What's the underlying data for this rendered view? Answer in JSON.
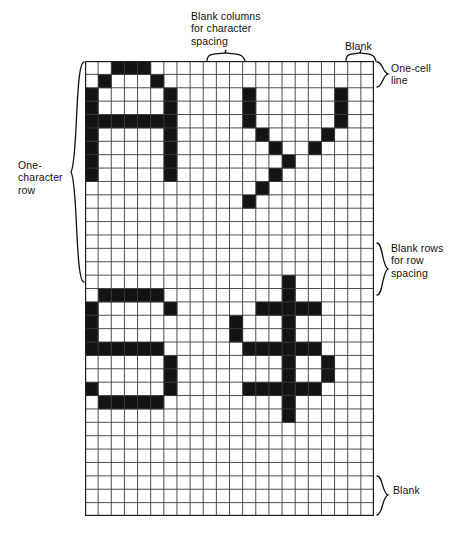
{
  "figure": {
    "grid": {
      "cols": 22,
      "rows": 34,
      "cell_width_px": 13.13,
      "cell_height_px": 13.38,
      "line_color": "#3a3a3a",
      "fill_color": "#141414",
      "background_color": "#ffffff"
    },
    "annotations": {
      "blank_columns": "Blank columns\nfor character\nspacing",
      "blank_top": "Blank",
      "one_cell_line": "One-cell\nline",
      "blank_rows": "Blank rows\nfor row\nspacing",
      "blank_bottom": "Blank",
      "one_character_row": "One-\ncharacter\nrow"
    },
    "characters": [
      {
        "glyph": "A",
        "row_band": "top",
        "origin_col": 0,
        "origin_row": 0
      },
      {
        "glyph": "Y",
        "row_band": "top",
        "origin_col": 11,
        "origin_row": 0
      },
      {
        "glyph": "S",
        "row_band": "bottom",
        "origin_col": 0,
        "origin_row": 17
      },
      {
        "glyph": "$",
        "row_band": "bottom",
        "origin_col": 11,
        "origin_row": 17
      }
    ],
    "filled_cells": [
      [
        2,
        0
      ],
      [
        3,
        0
      ],
      [
        4,
        0
      ],
      [
        1,
        1
      ],
      [
        5,
        1
      ],
      [
        0,
        2
      ],
      [
        6,
        2
      ],
      [
        0,
        3
      ],
      [
        6,
        3
      ],
      [
        0,
        4
      ],
      [
        1,
        4
      ],
      [
        2,
        4
      ],
      [
        3,
        4
      ],
      [
        4,
        4
      ],
      [
        5,
        4
      ],
      [
        6,
        4
      ],
      [
        0,
        5
      ],
      [
        6,
        5
      ],
      [
        0,
        6
      ],
      [
        6,
        6
      ],
      [
        0,
        7
      ],
      [
        6,
        7
      ],
      [
        0,
        8
      ],
      [
        6,
        8
      ],
      [
        12,
        2
      ],
      [
        19,
        2
      ],
      [
        12,
        3
      ],
      [
        19,
        3
      ],
      [
        12,
        4
      ],
      [
        19,
        4
      ],
      [
        13,
        5
      ],
      [
        18,
        5
      ],
      [
        14,
        6
      ],
      [
        17,
        6
      ],
      [
        15,
        7
      ],
      [
        14,
        8
      ],
      [
        13,
        9
      ],
      [
        12,
        10
      ],
      [
        1,
        17
      ],
      [
        2,
        17
      ],
      [
        3,
        17
      ],
      [
        4,
        17
      ],
      [
        5,
        17
      ],
      [
        0,
        18
      ],
      [
        6,
        18
      ],
      [
        0,
        19
      ],
      [
        0,
        20
      ],
      [
        0,
        21
      ],
      [
        1,
        21
      ],
      [
        2,
        21
      ],
      [
        3,
        21
      ],
      [
        4,
        21
      ],
      [
        5,
        21
      ],
      [
        6,
        22
      ],
      [
        6,
        23
      ],
      [
        0,
        24
      ],
      [
        6,
        24
      ],
      [
        1,
        25
      ],
      [
        2,
        25
      ],
      [
        3,
        25
      ],
      [
        4,
        25
      ],
      [
        5,
        25
      ],
      [
        15,
        16
      ],
      [
        15,
        17
      ],
      [
        13,
        18
      ],
      [
        14,
        18
      ],
      [
        15,
        18
      ],
      [
        16,
        18
      ],
      [
        17,
        18
      ],
      [
        11,
        19
      ],
      [
        15,
        19
      ],
      [
        11,
        20
      ],
      [
        15,
        20
      ],
      [
        12,
        21
      ],
      [
        13,
        21
      ],
      [
        14,
        21
      ],
      [
        15,
        21
      ],
      [
        16,
        21
      ],
      [
        17,
        21
      ],
      [
        15,
        22
      ],
      [
        18,
        22
      ],
      [
        15,
        23
      ],
      [
        18,
        23
      ],
      [
        12,
        24
      ],
      [
        13,
        24
      ],
      [
        14,
        24
      ],
      [
        15,
        24
      ],
      [
        16,
        24
      ],
      [
        17,
        24
      ],
      [
        15,
        25
      ],
      [
        15,
        26
      ]
    ]
  }
}
